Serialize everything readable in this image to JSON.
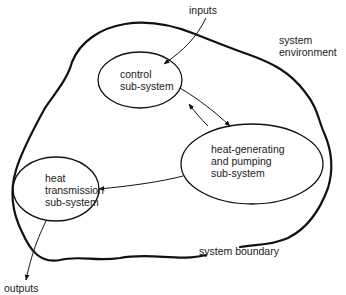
{
  "diagram": {
    "environment_label_line1": "system",
    "environment_label_line2": "environment",
    "boundary_label": "system boundary",
    "inputs_label": "inputs",
    "outputs_label": "outputs",
    "nodes": [
      {
        "id": "control",
        "line1": "control",
        "line2": "sub-system"
      },
      {
        "id": "heat_generating",
        "line1": "heat-generating",
        "line2": "and pumping",
        "line3": "sub-system"
      },
      {
        "id": "heat_transmission",
        "line1": "heat",
        "line2": "transmission",
        "line3": "sub-system"
      }
    ],
    "edges": [
      {
        "from": "inputs",
        "to": "control"
      },
      {
        "from": "control",
        "to": "heat_generating"
      },
      {
        "from": "heat_generating",
        "to": "control"
      },
      {
        "from": "heat_generating",
        "to": "heat_transmission"
      },
      {
        "from": "heat_transmission",
        "to": "outputs"
      }
    ],
    "stroke_color": "#111111"
  }
}
